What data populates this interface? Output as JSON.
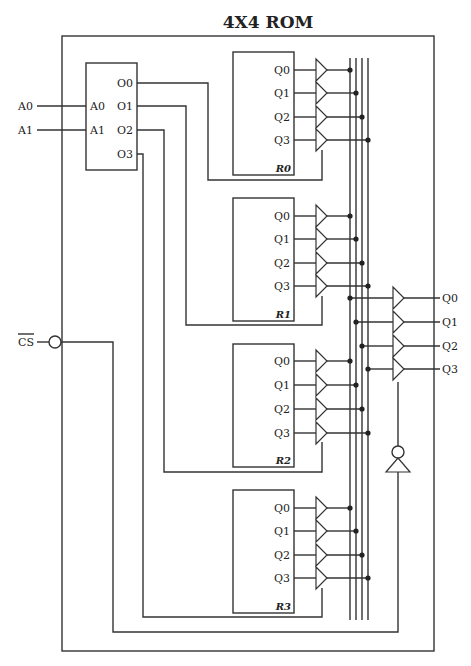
{
  "title": "4X4 ROM",
  "inputs": {
    "a0": "A0",
    "a1": "A1",
    "cs": "CS"
  },
  "decoder": {
    "inputs": [
      "A0",
      "A1"
    ],
    "outputs": [
      "O0",
      "O1",
      "O2",
      "O3"
    ]
  },
  "registers": [
    {
      "name": "R0",
      "outputs": [
        "Q0",
        "Q1",
        "Q2",
        "Q3"
      ]
    },
    {
      "name": "R1",
      "outputs": [
        "Q0",
        "Q1",
        "Q2",
        "Q3"
      ]
    },
    {
      "name": "R2",
      "outputs": [
        "Q0",
        "Q1",
        "Q2",
        "Q3"
      ]
    },
    {
      "name": "R3",
      "outputs": [
        "Q0",
        "Q1",
        "Q2",
        "Q3"
      ]
    }
  ],
  "outputs": [
    "Q0",
    "Q1",
    "Q2",
    "Q3"
  ],
  "colors": {
    "line": "#333333",
    "background": "#ffffff"
  }
}
